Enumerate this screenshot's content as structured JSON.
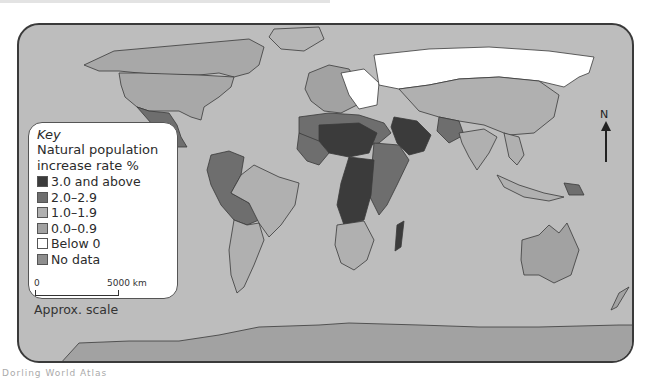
{
  "map": {
    "title": "World natural population increase rate",
    "colors": {
      "ocean": "#bdbdbd",
      "border": "#3a3a3a"
    }
  },
  "key": {
    "title": "Key",
    "subtitle_line1": "Natural population",
    "subtitle_line2": "increase rate %",
    "items": [
      {
        "label": "3.0 and above",
        "color": "#3b3b3b"
      },
      {
        "label": "2.0–2.9",
        "color": "#6e6e6e"
      },
      {
        "label": "1.0–1.9",
        "color": "#b0b0b0"
      },
      {
        "label": "0.0–0.9",
        "color": "#a2a2a2"
      },
      {
        "label": "Below 0",
        "color": "#ffffff"
      },
      {
        "label": "No data",
        "color": "#8e8e8e"
      }
    ]
  },
  "scale": {
    "start": "0",
    "end": "5000 km",
    "label": "Approx. scale"
  },
  "compass": {
    "label": "N"
  },
  "footer": {
    "text": "Dorling World Atlas"
  }
}
